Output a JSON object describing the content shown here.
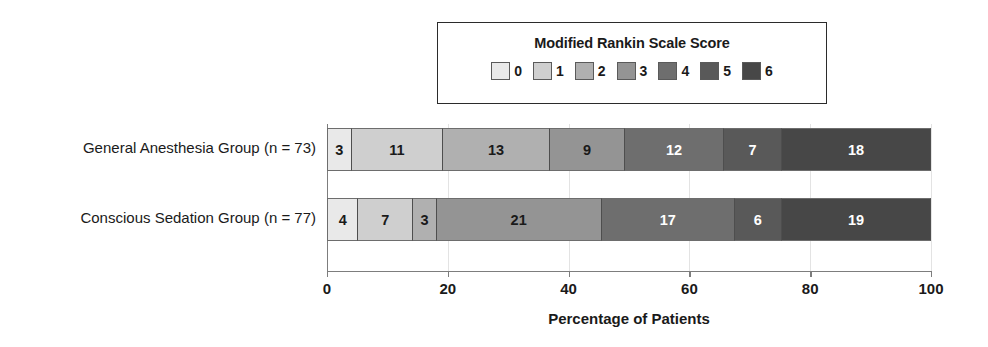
{
  "chart_data": {
    "type": "bar",
    "orientation": "horizontal",
    "stacked": true,
    "normalized_percent": true,
    "title": "",
    "xlabel": "Percentage of Patients",
    "ylabel": "",
    "xlim": [
      0,
      100
    ],
    "xticks": [
      0,
      20,
      40,
      60,
      80,
      100
    ],
    "xtick_labels": [
      "0",
      "20",
      "40",
      "60",
      "80",
      "100"
    ],
    "grid": true,
    "grid_axis": "x",
    "legend": {
      "title": "Modified Rankin Scale Score",
      "position": "top-center",
      "entries": [
        {
          "label": "0",
          "color": "#e9e9e9",
          "text_color": "#1a1a1a"
        },
        {
          "label": "1",
          "color": "#cfcfcf",
          "text_color": "#1a1a1a"
        },
        {
          "label": "2",
          "color": "#b0b0b0",
          "text_color": "#1a1a1a"
        },
        {
          "label": "3",
          "color": "#949494",
          "text_color": "#1a1a1a"
        },
        {
          "label": "4",
          "color": "#6e6e6e",
          "text_color": "#ffffff"
        },
        {
          "label": "5",
          "color": "#595959",
          "text_color": "#ffffff"
        },
        {
          "label": "6",
          "color": "#474747",
          "text_color": "#ffffff"
        }
      ]
    },
    "categories": [
      "General Anesthesia Group (n = 73)",
      "Conscious Sedation Group (n = 77)"
    ],
    "group_totals": [
      73,
      77
    ],
    "series": [
      {
        "name": "0",
        "values": [
          3,
          4
        ],
        "percents": [
          4.1,
          5.2
        ]
      },
      {
        "name": "1",
        "values": [
          11,
          7
        ],
        "percents": [
          15.1,
          9.1
        ]
      },
      {
        "name": "2",
        "values": [
          13,
          3
        ],
        "percents": [
          17.8,
          3.9
        ]
      },
      {
        "name": "3",
        "values": [
          9,
          21
        ],
        "percents": [
          12.3,
          27.3
        ]
      },
      {
        "name": "4",
        "values": [
          12,
          17
        ],
        "percents": [
          16.4,
          22.1
        ]
      },
      {
        "name": "5",
        "values": [
          7,
          6
        ],
        "percents": [
          9.6,
          7.8
        ]
      },
      {
        "name": "6",
        "values": [
          18,
          19
        ],
        "percents": [
          24.7,
          24.7
        ]
      }
    ],
    "bar_labels": [
      [
        "3",
        "11",
        "13",
        "9",
        "12",
        "7",
        "18"
      ],
      [
        "4",
        "7",
        "3",
        "21",
        "17",
        "6",
        "19"
      ]
    ]
  }
}
